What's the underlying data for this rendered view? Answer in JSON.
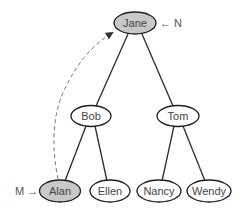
{
  "diagram": {
    "type": "binary-tree",
    "colors": {
      "highlight_fill": "#c8c8c8",
      "normal_fill": "#ffffff",
      "stroke": "#1e1e1e"
    },
    "nodes": {
      "jane": {
        "label": "Jane",
        "highlighted": true
      },
      "bob": {
        "label": "Bob",
        "highlighted": false
      },
      "tom": {
        "label": "Tom",
        "highlighted": false
      },
      "alan": {
        "label": "Alan",
        "highlighted": true
      },
      "ellen": {
        "label": "Ellen",
        "highlighted": false
      },
      "nancy": {
        "label": "Nancy",
        "highlighted": false
      },
      "wendy": {
        "label": "Wendy",
        "highlighted": false
      }
    },
    "edges": [
      [
        "Jane",
        "Bob"
      ],
      [
        "Jane",
        "Tom"
      ],
      [
        "Bob",
        "Alan"
      ],
      [
        "Bob",
        "Ellen"
      ],
      [
        "Tom",
        "Nancy"
      ],
      [
        "Tom",
        "Wendy"
      ]
    ],
    "pointers": {
      "n": {
        "label": "← N",
        "target": "Jane"
      },
      "m": {
        "label": "M →",
        "target": "Alan"
      }
    },
    "dashed_arrow": {
      "from": "Alan",
      "to": "Jane"
    }
  }
}
